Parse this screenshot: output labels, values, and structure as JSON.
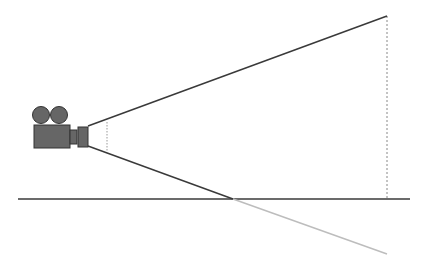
{
  "diagram": {
    "colors": {
      "background": "#ffffff",
      "line_dark": "#3a3a3a",
      "line_light": "#bdbdbd",
      "camera_fill": "#666666",
      "camera_stroke": "#333333",
      "dashed": "#888888"
    },
    "elements": {
      "camera": {
        "label": "movie-camera"
      },
      "ground_line": {
        "x1": 18,
        "y1": 199,
        "x2": 410,
        "y2": 199
      },
      "upper_ray": {
        "x1": 88,
        "y1": 126,
        "x2": 387,
        "y2": 16
      },
      "lower_ray_solid": {
        "x1": 88,
        "y1": 146,
        "x2": 233,
        "y2": 199
      },
      "lower_ray_extension": {
        "x1": 233,
        "y1": 199,
        "x2": 387,
        "y2": 254
      },
      "near_plane_dashed": {
        "x1": 107,
        "y1": 121,
        "x2": 107,
        "y2": 152
      },
      "far_plane_dashed": {
        "x1": 387,
        "y1": 16,
        "x2": 387,
        "y2": 199
      }
    }
  }
}
